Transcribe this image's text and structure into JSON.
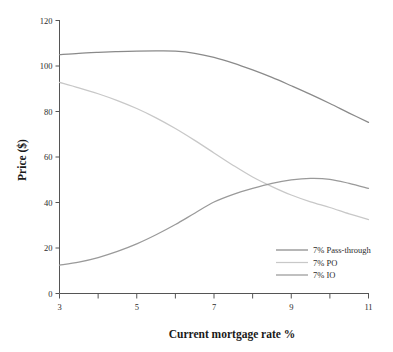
{
  "chart_data": {
    "type": "line",
    "title": "",
    "xlabel": "Current mortgage rate %",
    "ylabel": "Price ($)",
    "xlim": [
      3,
      11
    ],
    "ylim": [
      0,
      120
    ],
    "grid": false,
    "legend_position": "bottom-right",
    "x_ticks": [
      3,
      5,
      7,
      9,
      11
    ],
    "x_tick_labels": [
      "3",
      "5",
      "7",
      "9",
      "11"
    ],
    "x_minor_ticks": [
      4,
      6,
      8,
      10
    ],
    "y_ticks": [
      0,
      20,
      40,
      60,
      80,
      100,
      120
    ],
    "y_tick_labels": [
      "0",
      "20",
      "40",
      "60",
      "80",
      "100",
      "120"
    ],
    "x": [
      3,
      3.5,
      4,
      4.5,
      5,
      5.5,
      6,
      6.5,
      7,
      7.5,
      8,
      8.5,
      9,
      9.5,
      10,
      10.5,
      11
    ],
    "series": [
      {
        "name": "7% Pass-through",
        "color": "#8a8a8a",
        "values": [
          105.0,
          105.6,
          106.0,
          106.3,
          106.5,
          106.6,
          106.5,
          105.6,
          103.8,
          101.3,
          98.3,
          95.0,
          91.3,
          87.5,
          83.5,
          79.3,
          75.2
        ]
      },
      {
        "name": "7% PO",
        "color": "#c8c8c8",
        "values": [
          92.8,
          90.4,
          87.8,
          84.8,
          81.3,
          77.2,
          72.5,
          67.3,
          61.8,
          56.3,
          51.2,
          47.0,
          43.3,
          40.3,
          37.8,
          35.0,
          32.5
        ]
      },
      {
        "name": "7% IO",
        "color": "#9a9a9a",
        "values": [
          12.5,
          13.8,
          15.8,
          18.5,
          21.8,
          25.8,
          30.3,
          35.3,
          40.2,
          43.6,
          46.2,
          48.4,
          49.9,
          50.6,
          50.2,
          48.4,
          46.2
        ]
      }
    ]
  },
  "legend": {
    "entries": [
      {
        "label": "7% Pass-through"
      },
      {
        "label": "7% PO"
      },
      {
        "label": "7% IO"
      }
    ]
  }
}
